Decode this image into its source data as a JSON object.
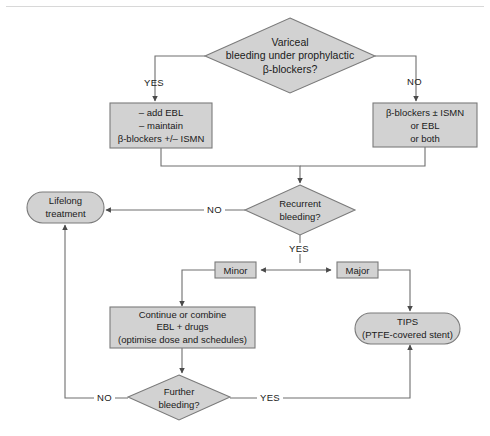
{
  "diagram": {
    "colors": {
      "shape_fill": "#d2d2d2",
      "shape_stroke": "#7a7a7a",
      "connector": "#6e6e6e",
      "text": "#1a1a1a",
      "background": "#ffffff"
    },
    "nodes": [
      {
        "id": "variceal-bleeding-decision",
        "shape": "diamond",
        "lines": [
          "Variceal",
          "bleeding under prophylactic",
          "β-blockers?"
        ]
      },
      {
        "id": "add-ebl-maintain-box",
        "shape": "rect",
        "lines": [
          "– add EBL",
          "– maintain",
          "β-blockers +/– ISMN"
        ]
      },
      {
        "id": "beta-blockers-ismn-box",
        "shape": "rect",
        "lines": [
          "β-blockers ± ISMN",
          "or EBL",
          "or both"
        ]
      },
      {
        "id": "recurrent-bleeding-decision",
        "shape": "diamond",
        "lines": [
          "Recurrent",
          "bleeding?"
        ]
      },
      {
        "id": "lifelong-treatment-box",
        "shape": "rounded",
        "lines": [
          "Lifelong",
          "treatment"
        ]
      },
      {
        "id": "minor-box",
        "shape": "rect",
        "lines": [
          "Minor"
        ]
      },
      {
        "id": "major-box",
        "shape": "rect",
        "lines": [
          "Major"
        ]
      },
      {
        "id": "continue-or-combine-box",
        "shape": "rect",
        "lines": [
          "Continue or combine",
          "EBL + drugs",
          "(optimise dose and schedules)"
        ]
      },
      {
        "id": "tips-box",
        "shape": "rounded",
        "lines": [
          "TIPS",
          "(PTFE-covered stent)"
        ]
      },
      {
        "id": "further-bleeding-decision",
        "shape": "diamond",
        "lines": [
          "Further",
          "bleeding?"
        ]
      }
    ],
    "edge_labels": {
      "top_yes": "YES",
      "top_no": "NO",
      "recurrent_no": "NO",
      "recurrent_yes": "YES",
      "further_no": "NO",
      "further_yes": "YES"
    }
  }
}
